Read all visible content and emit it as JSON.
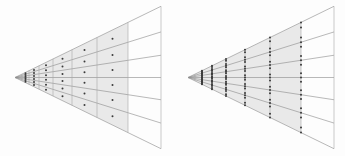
{
  "figure": {
    "background_color": "#fdfdfd",
    "shade_color": "#e9e9e9",
    "line_color": "#8a8a8a",
    "vertical_line_color": "#a8a8a8",
    "dot_color": "#3a3a3a",
    "width": 345,
    "height": 156
  },
  "chart_data": {
    "type": "diagram",
    "title": "",
    "xlabel": "",
    "ylabel": "",
    "panels": [
      {
        "name": "left-panel",
        "label": "",
        "apex": [
          15,
          77.5
        ],
        "half_angle_deg": 26.0,
        "radii": [
          7,
          14,
          24,
          38,
          57,
          82,
          113,
          146
        ],
        "shaded_radius_max": 113,
        "outer_radius": 146,
        "angular_divisions": 6,
        "sample_mode": "cell-centers",
        "samples_per_cell": 1,
        "dot_radius": 1.0
      },
      {
        "name": "right-panel",
        "label": "",
        "apex": [
          188,
          77.5
        ],
        "half_angle_deg": 26.0,
        "radii": [
          7,
          14,
          24,
          38,
          57,
          82,
          113,
          146
        ],
        "shaded_radius_max": 113,
        "outer_radius": 146,
        "angular_divisions": 6,
        "sample_mode": "along-vertical-lines",
        "samples_per_cell": 2,
        "dot_radius": 1.0
      }
    ],
    "grid": true,
    "legend": "none"
  }
}
